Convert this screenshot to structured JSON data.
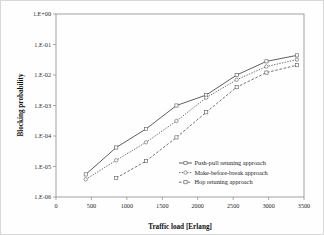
{
  "chart_data": {
    "type": "line",
    "title": "",
    "xlabel": "Traffic load [Erlang]",
    "ylabel": "Blocking probability",
    "xlim": [
      0,
      3500
    ],
    "ylim": [
      1e-06,
      1.0
    ],
    "yscale": "log",
    "grid": false,
    "legend_position": "inside-lower-right",
    "xticks": [
      0,
      500,
      1000,
      1500,
      2000,
      2500,
      3000,
      3500
    ],
    "xtick_labels": [
      "0",
      "500",
      "1000",
      "1500",
      "2000",
      "2500",
      "3000",
      "3500"
    ],
    "yticks": [
      1.0,
      0.1,
      0.01,
      0.001,
      0.0001,
      1e-05,
      1e-06
    ],
    "ytick_labels": [
      "1.E+00",
      "1.E-01",
      "1.E-02",
      "1.E-03",
      "1.E-04",
      "1.E-05",
      "1.E-06"
    ],
    "series": [
      {
        "name": "Push-pull retuning approach",
        "marker": "square",
        "linestyle": "solid",
        "x": [
          420,
          850,
          1270,
          1700,
          2120,
          2550,
          2970,
          3400
        ],
        "values": [
          5.5e-06,
          4.2e-05,
          0.00017,
          0.001,
          0.0022,
          0.01,
          0.028,
          0.044
        ]
      },
      {
        "name": "Make-before-break approach",
        "marker": "circle",
        "linestyle": "dotted",
        "x": [
          420,
          850,
          1270,
          1700,
          2120,
          2550,
          2970,
          3400
        ],
        "values": [
          3.8e-06,
          1.6e-05,
          6.2e-05,
          0.00031,
          0.0018,
          0.007,
          0.019,
          0.032
        ]
      },
      {
        "name": "Hop retuning approach",
        "marker": "square",
        "linestyle": "dashed",
        "x": [
          850,
          1270,
          1700,
          2120,
          2550,
          2970,
          3400
        ],
        "values": [
          4.2e-06,
          1.5e-05,
          9e-05,
          0.0006,
          0.004,
          0.012,
          0.021
        ]
      }
    ]
  },
  "axes": {
    "x_title": "Traffic load [Erlang]",
    "y_title": "Blocking probability"
  },
  "legend": {
    "entries": [
      "Push-pull retuning approach",
      "Make-before-break approach",
      "Hop retuning approach"
    ]
  }
}
